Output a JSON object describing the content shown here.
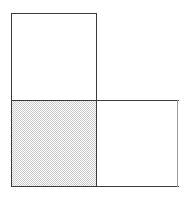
{
  "figure": {
    "title": "",
    "kind": "geometric-tiling-diagram",
    "canvas": {
      "width": 179,
      "height": 199,
      "background": "#ffffff"
    },
    "stroke": {
      "color": "#3a3a3a",
      "faint_color": "#9a9a9a",
      "width": 1
    },
    "shading": {
      "pattern": "checkerboard-dither",
      "cell_size_px": 2,
      "fill": "#c9c9c9",
      "ground": "#ffffff"
    },
    "grid": {
      "columns_x": [
        11,
        96,
        177
      ],
      "rows_y": [
        13,
        100,
        186
      ]
    },
    "cells": [
      {
        "name": "top-left-square",
        "fill": "white",
        "x": 11,
        "y": 13,
        "width": 85,
        "height": 87,
        "outlined": true
      },
      {
        "name": "bottom-left-square",
        "fill": "shaded",
        "x": 11,
        "y": 100,
        "width": 85,
        "height": 86,
        "outlined": true
      },
      {
        "name": "bottom-right-square",
        "fill": "white",
        "x": 96,
        "y": 100,
        "width": 81,
        "height": 86,
        "outlined": true
      }
    ],
    "edges": [
      {
        "name": "top-edge-upper-square",
        "orientation": "horizontal",
        "x": 11,
        "y": 13,
        "length": 86,
        "tone": "dark"
      },
      {
        "name": "middle-horizontal-edge",
        "orientation": "horizontal",
        "x": 11,
        "y": 100,
        "length": 168,
        "tone": "dark"
      },
      {
        "name": "bottom-horizontal-edge",
        "orientation": "horizontal",
        "x": 11,
        "y": 186,
        "length": 168,
        "tone": "dark"
      },
      {
        "name": "left-vertical-edge",
        "orientation": "vertical",
        "x": 11,
        "y": 13,
        "length": 174,
        "tone": "dark"
      },
      {
        "name": "middle-vertical-edge",
        "orientation": "vertical",
        "x": 96,
        "y": 13,
        "length": 174,
        "tone": "dark"
      },
      {
        "name": "right-vertical-edge",
        "orientation": "vertical",
        "x": 177,
        "y": 100,
        "length": 87,
        "tone": "faint"
      }
    ],
    "labels": []
  }
}
